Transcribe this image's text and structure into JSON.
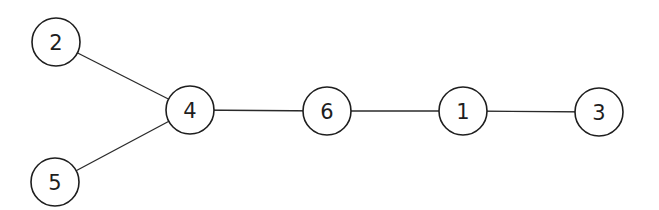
{
  "diagram": {
    "type": "tree-graph",
    "nodes": [
      {
        "id": "2",
        "label": "2",
        "x": 56,
        "y": 42
      },
      {
        "id": "5",
        "label": "5",
        "x": 55,
        "y": 182
      },
      {
        "id": "4",
        "label": "4",
        "x": 190,
        "y": 110
      },
      {
        "id": "6",
        "label": "6",
        "x": 327,
        "y": 111
      },
      {
        "id": "1",
        "label": "1",
        "x": 463,
        "y": 111
      },
      {
        "id": "3",
        "label": "3",
        "x": 599,
        "y": 112
      }
    ],
    "edges": [
      {
        "from": "2",
        "to": "4"
      },
      {
        "from": "5",
        "to": "4"
      },
      {
        "from": "4",
        "to": "6"
      },
      {
        "from": "6",
        "to": "1"
      },
      {
        "from": "1",
        "to": "3"
      }
    ],
    "node_radius": 24
  }
}
